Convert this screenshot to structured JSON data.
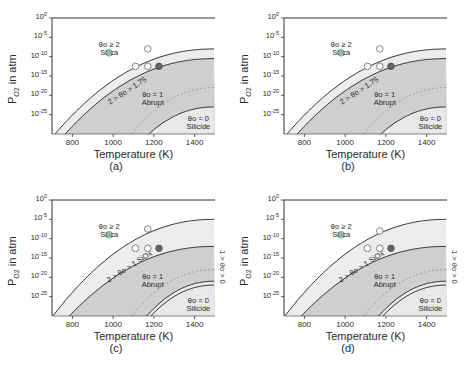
{
  "figure": {
    "panels": [
      {
        "id": "a",
        "caption": "(a)",
        "band_label": "2 > θo > 1.75"
      },
      {
        "id": "b",
        "caption": "(b)",
        "band_label": "2 > θo > 1.75"
      },
      {
        "id": "c",
        "caption": "(c)",
        "band_label": "2 > θo > 1 SiOx",
        "extra_label": "1 > θo > 0"
      },
      {
        "id": "d",
        "caption": "(d)",
        "band_label": "2 > θo > 1 SiOx",
        "extra_label": "1 > θo > 0"
      }
    ],
    "xlabel": "Temperature (K)",
    "ylabel_main": "P",
    "ylabel_sub": "O2",
    "ylabel_rest": " in atm",
    "xticks": [
      "800",
      "1000",
      "1200",
      "1400"
    ],
    "yticks": [
      {
        "base": "10",
        "exp": "0"
      },
      {
        "base": "10",
        "exp": "-5"
      },
      {
        "base": "10",
        "exp": "-10"
      },
      {
        "base": "10",
        "exp": "-15"
      },
      {
        "base": "10",
        "exp": "-20"
      },
      {
        "base": "10",
        "exp": "-25"
      }
    ],
    "region_labels": {
      "silica_theta": "θo ≥ 2",
      "silica": "Silica",
      "abrupt_theta": "θo = 1",
      "abrupt": "Abrupt",
      "silicide_theta": "θo = 0",
      "silicide": "Silicide"
    }
  },
  "chart_data": [
    {
      "type": "scatter",
      "panel": "(a)",
      "title": "",
      "xlabel": "Temperature (K)",
      "ylabel": "P_O2 in atm (log scale)",
      "xlim": [
        700,
        1500
      ],
      "ylim_log10": [
        -30,
        0
      ],
      "xticks": [
        800,
        1000,
        1200,
        1400
      ],
      "yticks_log10": [
        0,
        -5,
        -10,
        -15,
        -20,
        -25
      ],
      "regions": [
        "θo ≥ 2 Silica",
        "2 > θo > 1.75",
        "θo = 1 Abrupt",
        "θo = 0 Silicide"
      ],
      "series": [
        {
          "name": "open circles",
          "marker": "open",
          "points": [
            [
              980,
              -9
            ],
            [
              1110,
              -12.5
            ],
            [
              1170,
              -8
            ],
            [
              1170,
              -12.5
            ]
          ]
        },
        {
          "name": "filled circles",
          "marker": "filled",
          "points": [
            [
              1225,
              -12.5
            ]
          ]
        }
      ]
    },
    {
      "type": "scatter",
      "panel": "(b)",
      "title": "",
      "xlabel": "Temperature (K)",
      "ylabel": "P_O2 in atm (log scale)",
      "xlim": [
        700,
        1500
      ],
      "ylim_log10": [
        -30,
        0
      ],
      "xticks": [
        800,
        1000,
        1200,
        1400
      ],
      "yticks_log10": [
        0,
        -5,
        -10,
        -15,
        -20,
        -25
      ],
      "regions": [
        "θo ≥ 2 Silica",
        "2 > θo > 1.75",
        "θo = 1 Abrupt",
        "θo = 0 Silicide"
      ],
      "series": [
        {
          "name": "open circles",
          "marker": "open",
          "points": [
            [
              980,
              -9
            ],
            [
              1110,
              -12.5
            ],
            [
              1170,
              -8
            ],
            [
              1170,
              -12.5
            ]
          ]
        },
        {
          "name": "filled circles",
          "marker": "filled",
          "points": [
            [
              1225,
              -12.5
            ]
          ]
        }
      ]
    },
    {
      "type": "scatter",
      "panel": "(c)",
      "title": "",
      "xlabel": "Temperature (K)",
      "ylabel": "P_O2 in atm (log scale)",
      "xlim": [
        700,
        1500
      ],
      "ylim_log10": [
        -30,
        0
      ],
      "xticks": [
        800,
        1000,
        1200,
        1400
      ],
      "yticks_log10": [
        0,
        -5,
        -10,
        -15,
        -20,
        -25
      ],
      "regions": [
        "θo ≥ 2 Silica",
        "2 > θo > 1 SiOx",
        "θo = 1 Abrupt",
        "1 > θo > 0",
        "θo = 0 Silicide"
      ],
      "series": [
        {
          "name": "open circles",
          "marker": "open",
          "points": [
            [
              980,
              -9
            ],
            [
              1110,
              -12.5
            ],
            [
              1170,
              -7.5
            ],
            [
              1170,
              -12.5
            ]
          ]
        },
        {
          "name": "filled circles",
          "marker": "filled",
          "points": [
            [
              1225,
              -12.5
            ]
          ]
        }
      ]
    },
    {
      "type": "scatter",
      "panel": "(d)",
      "title": "",
      "xlabel": "Temperature (K)",
      "ylabel": "P_O2 in atm (log scale)",
      "xlim": [
        700,
        1500
      ],
      "ylim_log10": [
        -30,
        0
      ],
      "xticks": [
        800,
        1000,
        1200,
        1400
      ],
      "yticks_log10": [
        0,
        -5,
        -10,
        -15,
        -20,
        -25
      ],
      "regions": [
        "θo ≥ 2 Silica",
        "2 > θo > 1 SiOx",
        "θo = 1 Abrupt",
        "1 > θo > 0",
        "θo = 0 Silicide"
      ],
      "series": [
        {
          "name": "open circles",
          "marker": "open",
          "points": [
            [
              980,
              -9
            ],
            [
              1110,
              -12.5
            ],
            [
              1170,
              -8
            ],
            [
              1170,
              -12.5
            ]
          ]
        },
        {
          "name": "filled circles",
          "marker": "filled",
          "points": [
            [
              1225,
              -12.5
            ]
          ]
        }
      ]
    }
  ]
}
